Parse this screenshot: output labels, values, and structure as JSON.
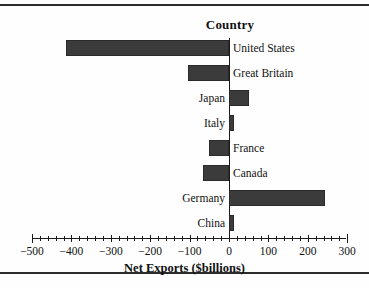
{
  "chart_data": {
    "type": "bar",
    "orientation": "horizontal",
    "title": "Country",
    "xlabel": "Net Exports ($billions)",
    "ylabel": "",
    "categories": [
      "United States",
      "Great Britain",
      "Japan",
      "Italy",
      "France",
      "Canada",
      "Germany",
      "China"
    ],
    "values": [
      -414,
      -104,
      51,
      13,
      -51,
      -66,
      244,
      13
    ],
    "xlim": [
      -500,
      300
    ],
    "xticks": [
      -500,
      -400,
      -300,
      -200,
      -100,
      0,
      100,
      200,
      300
    ],
    "xtick_labels": [
      "−500",
      "−400",
      "−300",
      "−200",
      "−100",
      "0",
      "100",
      "200",
      "300"
    ],
    "minor_tick_step": 20,
    "grid": false,
    "legend": false,
    "bar_color": "#3b3b3b",
    "axis_color": "#1a1a1a",
    "background": "#fefefe"
  },
  "axis": {
    "title": "Net Exports ($billions)",
    "ticks": [
      {
        "label": "−500",
        "value": -500
      },
      {
        "label": "−400",
        "value": -400
      },
      {
        "label": "−300",
        "value": -300
      },
      {
        "label": "−200",
        "value": -200
      },
      {
        "label": "−100",
        "value": -100
      },
      {
        "label": "0",
        "value": 0
      },
      {
        "label": "100",
        "value": 100
      },
      {
        "label": "200",
        "value": 200
      },
      {
        "label": "300",
        "value": 300
      }
    ]
  },
  "header": {
    "title": "Country"
  }
}
